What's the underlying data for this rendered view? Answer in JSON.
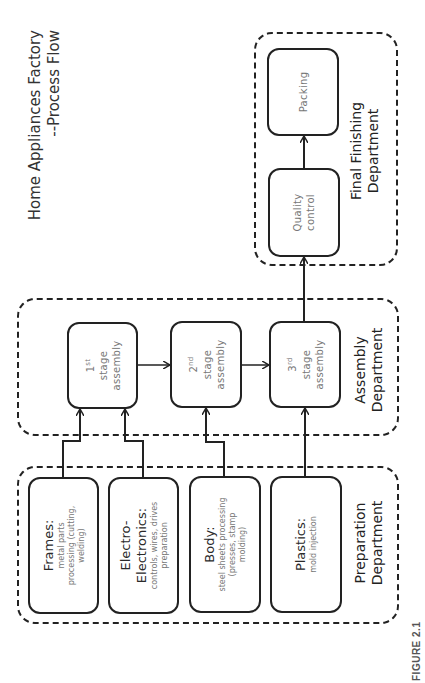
{
  "title": {
    "line1": "Home Appliances Factory",
    "line2": "--Process Flow"
  },
  "departments": {
    "final": {
      "label_line1": "Final Finishing",
      "label_line2": "Department"
    },
    "assembly": {
      "label_line1": "Assembly",
      "label_line2": "Department"
    },
    "preparation": {
      "label_line1": "Preparation",
      "label_line2": "Department"
    }
  },
  "final_nodes": [
    {
      "label": "Quality control"
    },
    {
      "label": "Packing"
    }
  ],
  "assembly_nodes": [
    {
      "ordinal": "1",
      "suffix": "st",
      "line2": "stage",
      "line3": "assembly"
    },
    {
      "ordinal": "2",
      "suffix": "nd",
      "line2": "stage",
      "line3": "assembly"
    },
    {
      "ordinal": "3",
      "suffix": "rd",
      "line2": "stage",
      "line3": "assembly"
    }
  ],
  "preparation_nodes": [
    {
      "title": "Frames:",
      "detail": "metal parts processing (cutting, welding)"
    },
    {
      "title": "Electro-Electronics:",
      "detail": "controls, wires, drives preparation"
    },
    {
      "title": "Body:",
      "detail": "steel sheets processing (presses, stamp molding)"
    },
    {
      "title": "Plastics:",
      "detail": "mold injection"
    }
  ],
  "flows": [
    {
      "from": "Frames",
      "to": "1st stage assembly"
    },
    {
      "from": "Electro-Electronics",
      "to": "1st stage assembly"
    },
    {
      "from": "Body",
      "to": "2nd stage assembly"
    },
    {
      "from": "Plastics",
      "to": "3rd stage assembly"
    },
    {
      "from": "1st stage assembly",
      "to": "2nd stage assembly"
    },
    {
      "from": "2nd stage assembly",
      "to": "3rd stage assembly"
    },
    {
      "from": "3rd stage assembly",
      "to": "Quality control"
    },
    {
      "from": "Quality control",
      "to": "Packing"
    }
  ],
  "caption": "FIGURE 2.1",
  "colors": {
    "line": "#222222",
    "node_text": "#777777",
    "label_text": "#222222"
  }
}
